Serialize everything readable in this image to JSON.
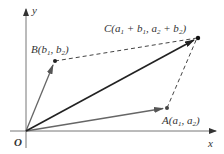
{
  "diagram": {
    "axes": {
      "x_label": "x",
      "y_label": "y",
      "origin_label": "O"
    },
    "points": {
      "B": {
        "name": "B",
        "label_main": "B(b",
        "c1": "1",
        "mid": ", b",
        "c2": "2",
        "end": ")"
      },
      "C": {
        "name": "C",
        "label_prefix": "C(a",
        "s1": "1",
        "p1": " + b",
        "s2": "1",
        "p2": ", a",
        "s3": "2",
        "p3": " + b",
        "s4": "2",
        "end": ")"
      },
      "A": {
        "name": "A",
        "label_main": "A(a",
        "c1": "1",
        "mid": ", a",
        "c2": "2",
        "end": ")"
      }
    },
    "colors": {
      "axis": "#555555",
      "vector_sum": "#222222",
      "vector_side": "#666666",
      "dashed": "#444444"
    }
  }
}
